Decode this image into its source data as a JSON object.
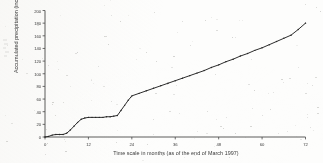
{
  "chart_data": {
    "type": "line",
    "title": "",
    "subtitle": "",
    "xlabel": "Time scale in months (as of the end of March 1997)",
    "ylabel": "Accumulated precipitation (inches)",
    "xlim": [
      0,
      72
    ],
    "ylim": [
      0,
      200
    ],
    "grid": false,
    "legend": null,
    "x_ticks": [
      0,
      12,
      24,
      36,
      48,
      60,
      72
    ],
    "y_ticks": [
      0,
      20,
      40,
      60,
      80,
      100,
      120,
      140,
      160,
      180,
      200
    ],
    "x_tick_labels": [
      "0",
      "12",
      "24",
      "36",
      "48",
      "60",
      "72"
    ],
    "y_tick_labels": [
      "0",
      "20",
      "40",
      "60",
      "80",
      "100",
      "120",
      "140",
      "160",
      "180",
      "200"
    ],
    "series": [
      {
        "name": "Accumulated precipitation",
        "marker": "dot",
        "x": [
          0,
          1,
          2,
          3,
          4,
          5,
          6,
          7,
          8,
          9,
          10,
          11,
          12,
          13,
          14,
          15,
          16,
          17,
          18,
          19,
          20,
          21,
          22,
          23,
          24,
          26,
          28,
          30,
          32,
          34,
          36,
          38,
          40,
          42,
          44,
          46,
          48,
          50,
          52,
          54,
          56,
          58,
          60,
          62,
          64,
          66,
          68,
          70,
          72
        ],
        "y": [
          0,
          1,
          3,
          4,
          4,
          4,
          6,
          11,
          17,
          23,
          28,
          30,
          31,
          31,
          31,
          31,
          31,
          32,
          32,
          33,
          34,
          42,
          50,
          58,
          65,
          69,
          73,
          77,
          81,
          85,
          89,
          93,
          97,
          101,
          105,
          110,
          114,
          119,
          123,
          128,
          132,
          137,
          141,
          146,
          151,
          156,
          161,
          170,
          180
        ]
      }
    ]
  },
  "axis_titles": {
    "x": "Time scale in months (as of the end of March 1997)",
    "y": "Accumulated precipitation (inches)"
  }
}
